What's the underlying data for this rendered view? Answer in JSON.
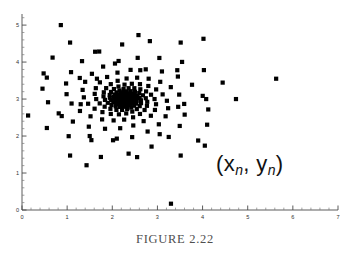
{
  "figure": {
    "caption": "FIGURE 2.22",
    "annotation": {
      "open_paren": "(",
      "var_x": "x",
      "sub_x": "n",
      "comma": ", ",
      "var_y": "y",
      "sub_y": "n",
      "close_paren": ")",
      "full_text": "(xn, yn)"
    },
    "point_color": "#000000",
    "axis_color": "#4a4a4a"
  },
  "chart_data": {
    "type": "scatter",
    "title": "",
    "xlabel": "",
    "ylabel": "",
    "xlim": [
      0,
      7
    ],
    "ylim": [
      0,
      5.3
    ],
    "grid": false,
    "legend": null,
    "xticks": [
      0,
      1,
      2,
      3,
      4,
      5,
      6,
      7
    ],
    "xticklabels": [
      "0",
      "1",
      "2",
      "3",
      "4",
      "5",
      "6",
      "7"
    ],
    "yticks": [
      0,
      1,
      2,
      3,
      4,
      5
    ],
    "yticklabels": [
      "0",
      "1",
      "2",
      "3",
      "4",
      "5"
    ],
    "minor_ticks_per_interval": 5,
    "marker": "square",
    "marker_size": 2.1,
    "spiral": {
      "center": [
        2.29,
        3.0
      ],
      "arms": 6,
      "points_per_arm": 42,
      "r0": 2.45,
      "decay": 0.915,
      "dtheta_deg": 16.0,
      "phase_offset_deg": 60.0,
      "aspect_y_over_x": 0.72
    },
    "outliers": [
      [
        0.55,
        3.58
      ],
      [
        0.86,
        5.0
      ],
      [
        0.88,
        2.54
      ],
      [
        1.28,
        3.57
      ],
      [
        1.3,
        2.86
      ],
      [
        1.43,
        1.21
      ],
      [
        1.5,
        2.0
      ],
      [
        1.62,
        4.28
      ],
      [
        1.66,
        3.55
      ],
      [
        2.06,
        3.96
      ],
      [
        2.1,
        1.93
      ],
      [
        2.55,
        1.43
      ],
      [
        2.58,
        4.73
      ],
      [
        2.62,
        3.78
      ],
      [
        3.05,
        2.05
      ],
      [
        3.3,
        0.17
      ],
      [
        3.44,
        3.78
      ],
      [
        3.46,
        2.79
      ],
      [
        4.02,
        4.63
      ],
      [
        4.05,
        1.74
      ],
      [
        4.08,
        3.0
      ],
      [
        5.63,
        3.55
      ]
    ]
  }
}
